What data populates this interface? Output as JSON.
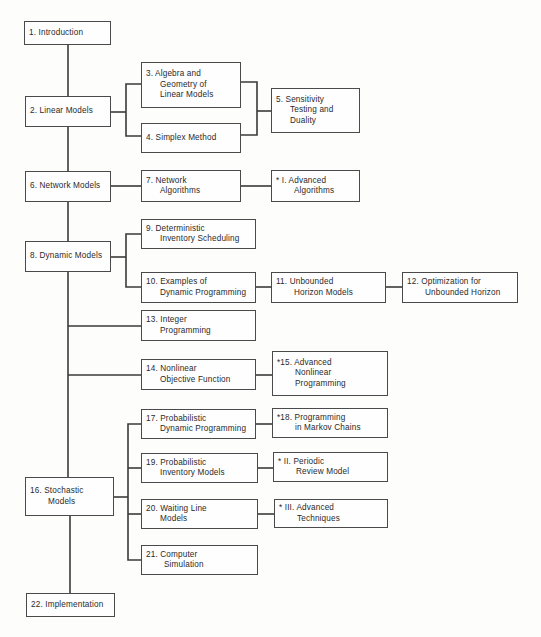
{
  "diagram": {
    "type": "chapter-dependency-flowchart",
    "nodes": [
      {
        "id": "1",
        "lines": [
          "1. Introduction"
        ]
      },
      {
        "id": "2",
        "lines": [
          "2. Linear Models"
        ]
      },
      {
        "id": "3",
        "lines": [
          "3. Algebra and",
          "Geometry of",
          "Linear Models"
        ]
      },
      {
        "id": "4",
        "lines": [
          "4. Simplex Method"
        ]
      },
      {
        "id": "5",
        "lines": [
          "5. Sensitivity",
          "Testing and",
          "Duality"
        ]
      },
      {
        "id": "6",
        "lines": [
          "6. Network Models"
        ]
      },
      {
        "id": "7",
        "lines": [
          "7. Network",
          "Algorithms"
        ]
      },
      {
        "id": "I",
        "lines": [
          "* I. Advanced",
          "Algorithms"
        ]
      },
      {
        "id": "8",
        "lines": [
          "8. Dynamic Models"
        ]
      },
      {
        "id": "9",
        "lines": [
          "9. Deterministic",
          "Inventory Scheduling"
        ]
      },
      {
        "id": "10",
        "lines": [
          "10. Examples of",
          "Dynamic Programming"
        ]
      },
      {
        "id": "11",
        "lines": [
          "11. Unbounded",
          "Horizon Models"
        ]
      },
      {
        "id": "12",
        "lines": [
          "12. Optimization for",
          "Unbounded Horizon"
        ]
      },
      {
        "id": "13",
        "lines": [
          "13. Integer",
          "Programming"
        ]
      },
      {
        "id": "14",
        "lines": [
          "14. Nonlinear",
          "Objective Function"
        ]
      },
      {
        "id": "15",
        "lines": [
          "*15. Advanced",
          "Nonlinear",
          "Programming"
        ]
      },
      {
        "id": "16",
        "lines": [
          "16. Stochastic",
          "Models"
        ]
      },
      {
        "id": "17",
        "lines": [
          "17. Probabilistic",
          "Dynamic Programming"
        ]
      },
      {
        "id": "18",
        "lines": [
          "*18. Programming",
          "in Markov Chains"
        ]
      },
      {
        "id": "19",
        "lines": [
          "19. Probabilistic",
          "Inventory Models"
        ]
      },
      {
        "id": "II",
        "lines": [
          "* II. Periodic",
          "Review Model"
        ]
      },
      {
        "id": "20",
        "lines": [
          "20. Waiting Line",
          "Models"
        ]
      },
      {
        "id": "III",
        "lines": [
          "* III. Advanced",
          "Techniques"
        ]
      },
      {
        "id": "21",
        "lines": [
          "21. Computer",
          "Simulation"
        ]
      },
      {
        "id": "22",
        "lines": [
          "22. Implementation"
        ]
      }
    ],
    "edges": [
      [
        "1",
        "2"
      ],
      [
        "2",
        "3"
      ],
      [
        "2",
        "4"
      ],
      [
        "3",
        "5"
      ],
      [
        "4",
        "5"
      ],
      [
        "2",
        "6"
      ],
      [
        "6",
        "7"
      ],
      [
        "7",
        "I"
      ],
      [
        "6",
        "8"
      ],
      [
        "8",
        "9"
      ],
      [
        "8",
        "10"
      ],
      [
        "10",
        "11"
      ],
      [
        "11",
        "12"
      ],
      [
        "8",
        "13"
      ],
      [
        "8",
        "14"
      ],
      [
        "14",
        "15"
      ],
      [
        "8",
        "16"
      ],
      [
        "16",
        "17"
      ],
      [
        "17",
        "18"
      ],
      [
        "16",
        "19"
      ],
      [
        "19",
        "II"
      ],
      [
        "16",
        "20"
      ],
      [
        "20",
        "III"
      ],
      [
        "16",
        "21"
      ],
      [
        "16",
        "22"
      ]
    ]
  }
}
